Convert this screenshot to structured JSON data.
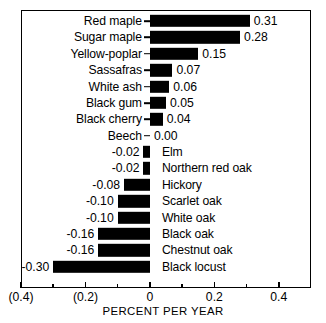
{
  "chart_data": {
    "type": "bar",
    "orientation": "horizontal",
    "title": "",
    "xlabel": "PERCENT PER YEAR",
    "ylabel": "",
    "xlim": [
      -0.4,
      0.5
    ],
    "grid": false,
    "legend": null,
    "categories": [
      "Red maple",
      "Sugar maple",
      "Yellow-poplar",
      "Sassafras",
      "White ash",
      "Black gum",
      "Black cherry",
      "Beech",
      "Elm",
      "Northern red oak",
      "Hickory",
      "Scarlet oak",
      "White oak",
      "Black oak",
      "Chestnut oak",
      "Black locust"
    ],
    "values": [
      0.31,
      0.28,
      0.15,
      0.07,
      0.06,
      0.05,
      0.04,
      0.0,
      -0.02,
      -0.02,
      -0.08,
      -0.1,
      -0.1,
      -0.16,
      -0.16,
      -0.3
    ],
    "data_labels": [
      "0.31",
      "0.28",
      "0.15",
      "0.07",
      "0.06",
      "0.05",
      "0.04",
      "0.00",
      "-0.02",
      "-0.02",
      "-0.08",
      "-0.10",
      "-0.10",
      "-0.16",
      "-0.16",
      "-0.30"
    ],
    "xticks": [
      -0.4,
      -0.2,
      0,
      0.2,
      0.4
    ],
    "xticklabels": [
      "(0.4)",
      "(0.2)",
      "0",
      "0.2",
      "0.4"
    ],
    "minor_xticks": [
      -0.3,
      -0.1,
      0.1,
      0.3
    ],
    "bar_color": "#000000",
    "background_color": "#ffffff",
    "frame": true
  }
}
